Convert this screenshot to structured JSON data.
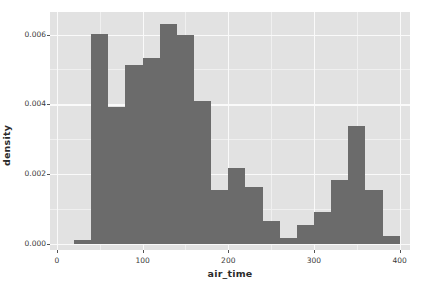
{
  "chart_data": {
    "type": "bar",
    "title": "",
    "subtitle": "",
    "xlabel": "air_time",
    "ylabel": "density",
    "xlim": [
      -8,
      412
    ],
    "ylim": [
      -0.00018,
      0.00665
    ],
    "grid": true,
    "legend": null,
    "bin_width": 20,
    "x_ticks": [
      {
        "value": 0,
        "label": "0"
      },
      {
        "value": 100,
        "label": "100"
      },
      {
        "value": 200,
        "label": "200"
      },
      {
        "value": 300,
        "label": "300"
      },
      {
        "value": 400,
        "label": "400"
      }
    ],
    "y_ticks": [
      {
        "value": 0.0,
        "label": "0.000"
      },
      {
        "value": 0.002,
        "label": "0.002"
      },
      {
        "value": 0.004,
        "label": "0.004"
      },
      {
        "value": 0.006,
        "label": "0.006"
      }
    ],
    "x_minor_ticks": [
      50,
      150,
      250,
      350
    ],
    "y_minor_ticks": [
      0.001,
      0.003,
      0.005
    ],
    "bars": [
      {
        "x0": 20,
        "x1": 40,
        "value": 0.0001
      },
      {
        "x0": 40,
        "x1": 60,
        "value": 0.00601
      },
      {
        "x0": 60,
        "x1": 80,
        "value": 0.00393
      },
      {
        "x0": 80,
        "x1": 100,
        "value": 0.00513
      },
      {
        "x0": 100,
        "x1": 120,
        "value": 0.00533
      },
      {
        "x0": 120,
        "x1": 140,
        "value": 0.00632
      },
      {
        "x0": 140,
        "x1": 160,
        "value": 0.006
      },
      {
        "x0": 160,
        "x1": 180,
        "value": 0.0041
      },
      {
        "x0": 180,
        "x1": 200,
        "value": 0.00153
      },
      {
        "x0": 200,
        "x1": 220,
        "value": 0.00216
      },
      {
        "x0": 220,
        "x1": 240,
        "value": 0.00164
      },
      {
        "x0": 240,
        "x1": 260,
        "value": 0.00064
      },
      {
        "x0": 260,
        "x1": 280,
        "value": 0.00016
      },
      {
        "x0": 280,
        "x1": 300,
        "value": 0.00054
      },
      {
        "x0": 300,
        "x1": 320,
        "value": 0.00092
      },
      {
        "x0": 320,
        "x1": 340,
        "value": 0.00184
      },
      {
        "x0": 340,
        "x1": 360,
        "value": 0.00339
      },
      {
        "x0": 360,
        "x1": 380,
        "value": 0.00153
      },
      {
        "x0": 380,
        "x1": 400,
        "value": 0.00021
      }
    ],
    "colors": {
      "bar_fill": "#6b6b6b",
      "panel_background": "#e2e2e2",
      "major_grid": "#fafafa",
      "minor_grid": "#f0f0f0",
      "axis_text": "#3a3a3a",
      "axis_title": "#2b2b2b",
      "figure_background": "#ffffff"
    }
  }
}
